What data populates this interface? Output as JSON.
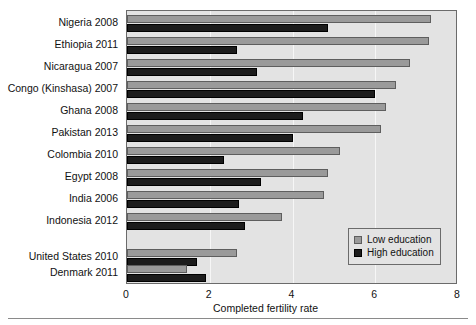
{
  "chart_data": {
    "type": "bar",
    "orientation": "horizontal",
    "title": "",
    "xlabel": "Completed fertility rate",
    "ylabel": "",
    "xlim": [
      0,
      8
    ],
    "xticks": [
      0,
      2,
      4,
      6,
      8
    ],
    "xticklabels": [
      "0",
      "2",
      "4",
      "6",
      "8"
    ],
    "grid": true,
    "grid_axis": "x",
    "legend_position": "lower right",
    "categories": [
      "Nigeria 2008",
      "Ethiopia 2011",
      "Nicaragua 2007",
      "Congo (Kinshasa) 2007",
      "Ghana 2008",
      "Pakistan 2013",
      "Colombia 2010",
      "Egypt 2008",
      "India 2006",
      "Indonesia 2012",
      "United States 2010",
      "Denmark 2011"
    ],
    "series": [
      {
        "name": "Low education",
        "color": "#9a9a9a",
        "values": [
          7.35,
          7.3,
          6.85,
          6.5,
          6.25,
          6.15,
          5.15,
          4.85,
          4.75,
          3.75,
          2.65,
          1.45
        ]
      },
      {
        "name": "High education",
        "color": "#1c1c1c",
        "values": [
          4.85,
          2.65,
          3.15,
          6.0,
          4.25,
          4.0,
          2.35,
          3.25,
          2.7,
          2.85,
          1.7,
          1.9
        ]
      }
    ]
  },
  "legend": {
    "items": [
      {
        "label": "Low education",
        "key": "low"
      },
      {
        "label": "High education",
        "key": "high"
      }
    ]
  }
}
